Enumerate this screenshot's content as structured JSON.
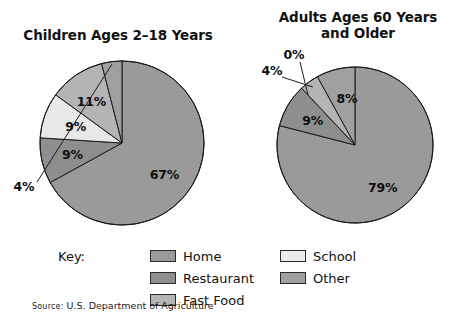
{
  "figure": {
    "source_prefix": "Source:",
    "source_text": "U.S. Department of Agriculture",
    "key_label": "Key:"
  },
  "palette": {
    "home": "#9a9a9a",
    "restaurant": "#8e8e8e",
    "fast_food": "#b4b4b4",
    "school": "#e8e8e8",
    "other": "#a0a0a0",
    "outline": "#1a1a1a",
    "background": "#ffffff"
  },
  "legend": {
    "columns": [
      {
        "items": [
          {
            "label": "Home",
            "color": "#9a9a9a"
          },
          {
            "label": "Restaurant",
            "color": "#8e8e8e"
          },
          {
            "label": "Fast Food",
            "color": "#b4b4b4"
          }
        ]
      },
      {
        "items": [
          {
            "label": "School",
            "color": "#ececec"
          },
          {
            "label": "Other",
            "color": "#a0a0a0"
          }
        ]
      }
    ]
  },
  "charts": [
    {
      "id": "children",
      "title": "Children Ages 2–18 Years",
      "center": {
        "x": 122,
        "y": 143
      },
      "radius": 82,
      "labels": {
        "home": "67%",
        "restaurant": "9%",
        "school": "9%",
        "fast_food": "11%",
        "other": "4%"
      }
    },
    {
      "id": "adults",
      "title": "Adults Ages 60 Years and Older",
      "center": {
        "x": 355,
        "y": 145
      },
      "radius": 78,
      "labels": {
        "home": "79%",
        "restaurant": "9%",
        "school": "0%",
        "fast_food": "4%",
        "other": "8%"
      }
    }
  ],
  "chart_data": [
    {
      "type": "pie",
      "title": "Children Ages 2–18 Years",
      "categories": [
        "Home",
        "Restaurant",
        "School",
        "Fast Food",
        "Other"
      ],
      "values": [
        67,
        9,
        9,
        11,
        4
      ],
      "unit": "percent",
      "data_labels": [
        "67%",
        "9%",
        "9%",
        "11%",
        "4%"
      ],
      "colors": [
        "#9a9a9a",
        "#8e8e8e",
        "#e8e8e8",
        "#b4b4b4",
        "#a0a0a0"
      ],
      "legend_position": "bottom",
      "start_angle_deg": 0,
      "direction": "clockwise_from_top_reversed"
    },
    {
      "type": "pie",
      "title": "Adults Ages 60 Years and Older",
      "categories": [
        "Home",
        "Restaurant",
        "School",
        "Fast Food",
        "Other"
      ],
      "values": [
        79,
        9,
        0,
        4,
        8
      ],
      "unit": "percent",
      "data_labels": [
        "79%",
        "9%",
        "0%",
        "4%",
        "8%"
      ],
      "colors": [
        "#9a9a9a",
        "#8e8e8e",
        "#e8e8e8",
        "#b4b4b4",
        "#a0a0a0"
      ],
      "legend_position": "bottom",
      "start_angle_deg": 0,
      "direction": "clockwise_from_top_reversed"
    }
  ],
  "source": {
    "prefix": "Source:",
    "text": "U.S. Department of Agriculture"
  }
}
